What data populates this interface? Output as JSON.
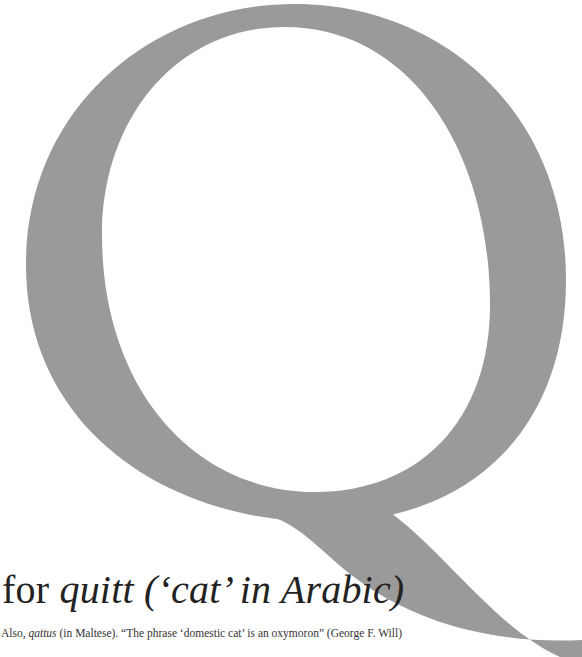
{
  "glyph": {
    "letter": "Q",
    "color": "#9a9a9a",
    "background": "#ffffff"
  },
  "heading": {
    "prefix": "for ",
    "word": "quitt",
    "gloss": " (‘cat’ in Arabic)"
  },
  "caption": {
    "lead": "Also, ",
    "word": "qattus",
    "rest": " (in Maltese). “The phrase ‘domestic cat’ is an oxymoron” (George F. Will)"
  }
}
